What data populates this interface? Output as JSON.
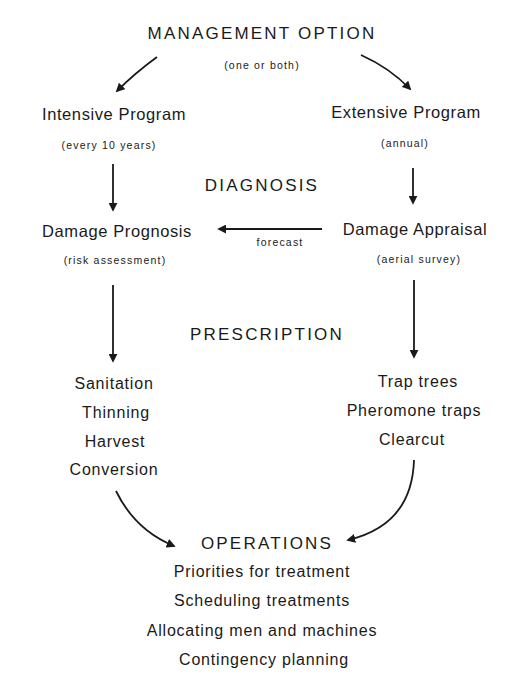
{
  "diagram": {
    "title": "MANAGEMENT OPTION",
    "title_note": "(one or both)",
    "programs": {
      "intensive": {
        "label": "Intensive Program",
        "note": "(every 10 years)"
      },
      "extensive": {
        "label": "Extensive Program",
        "note": "(annual)"
      }
    },
    "stages": {
      "diagnosis": "DIAGNOSIS",
      "prescription": "PRESCRIPTION",
      "operations": "OPERATIONS"
    },
    "diagnosis_nodes": {
      "prognosis": {
        "label": "Damage Prognosis",
        "note": "(risk assessment)"
      },
      "appraisal": {
        "label": "Damage Appraisal",
        "note": "(aerial survey)"
      },
      "link_label": "forecast"
    },
    "prescription_intensive": [
      "Sanitation",
      "Thinning",
      "Harvest",
      "Conversion"
    ],
    "prescription_extensive": [
      "Trap trees",
      "Pheromone traps",
      "Clearcut"
    ],
    "operations_items": [
      "Priorities for treatment",
      "Scheduling treatments",
      "Allocating men and machines",
      "Contingency planning"
    ],
    "colors": {
      "ink": "#1a1a1a",
      "background": "#ffffff"
    }
  }
}
